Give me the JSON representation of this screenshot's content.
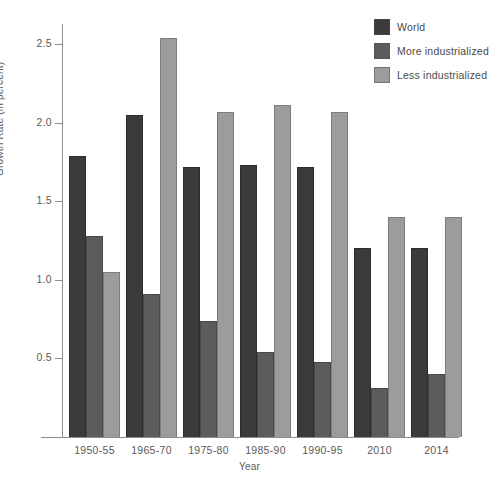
{
  "chart_data": {
    "type": "bar",
    "title": "",
    "xlabel": "Year",
    "ylabel": "Growth Rate (in percent)",
    "categories": [
      "1950-55",
      "1965-70",
      "1975-80",
      "1985-90",
      "1990-95",
      "2010",
      "2014"
    ],
    "series": [
      {
        "name": "World",
        "color": "#3d3a3a",
        "values": [
          1.79,
          2.05,
          1.72,
          1.73,
          1.72,
          1.2,
          1.2
        ]
      },
      {
        "name": "More industrialized",
        "color": "#5d5b5b",
        "values": [
          1.28,
          0.91,
          0.74,
          0.54,
          0.48,
          0.31,
          0.4
        ]
      },
      {
        "name": "Less industrialized",
        "color": "#9d9c9c",
        "values": [
          1.05,
          2.54,
          2.07,
          2.11,
          2.07,
          1.4,
          1.4
        ]
      }
    ],
    "ylim": [
      0,
      2.65
    ],
    "yticks": [
      0.5,
      1.0,
      1.5,
      2.0,
      2.5
    ],
    "ytick_labels": [
      "0.5",
      "1.0",
      "1.5",
      "2.0",
      "2.5"
    ],
    "grid": false,
    "legend_position": "top-right"
  },
  "legend": {
    "items": [
      {
        "label": "World"
      },
      {
        "label": "More industrialized"
      },
      {
        "label": "Less industrialized"
      }
    ]
  }
}
